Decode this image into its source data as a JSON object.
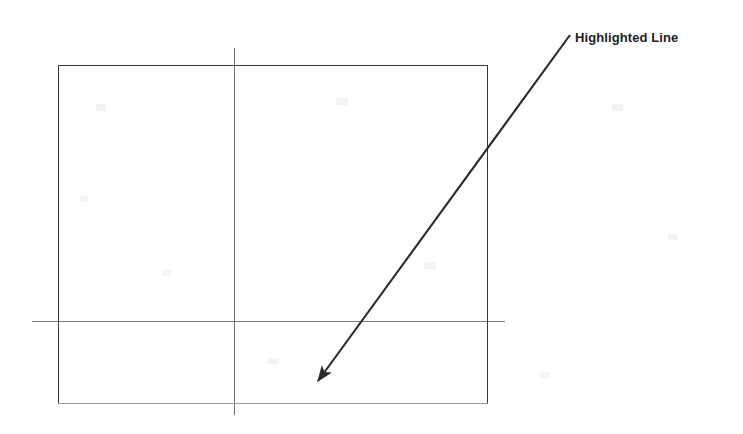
{
  "figure": {
    "background_color": "#ffffff",
    "width": 743,
    "height": 434,
    "annotation": {
      "label": "Highlighted Line",
      "label_color": "#1d1d1d",
      "leader_color": "#2b2b2b",
      "leader_start": [
        570,
        35
      ],
      "leader_tip": [
        311,
        390
      ],
      "arrowhead": "solid-triangle"
    },
    "shapes": {
      "rectangle": {
        "name": "outline-rectangle",
        "x": 58,
        "y": 65,
        "width": 430,
        "height": 339,
        "stroke_color": "#3a3a3a",
        "stroke_width": 1.6,
        "bottom_edge_color": "#9a9a9a",
        "bottom_edge_width": 1.2
      },
      "vertical_line": {
        "name": "vertical-centerline",
        "x": 234,
        "y1": 48,
        "y2": 415,
        "stroke_color": "#6f6f6f",
        "stroke_width": 1.2
      },
      "horizontal_line": {
        "name": "horizontal-centerline",
        "x1": 32,
        "x2": 505,
        "y": 321,
        "stroke_color": "#777777",
        "stroke_width": 1.2
      }
    },
    "artifacts": [
      {
        "x": 96,
        "y": 104,
        "w": 10,
        "h": 7,
        "color": "#f0f0f0"
      },
      {
        "x": 336,
        "y": 98,
        "w": 12,
        "h": 7,
        "color": "#f1f1f1"
      },
      {
        "x": 612,
        "y": 104,
        "w": 11,
        "h": 7,
        "color": "#f1f1f1"
      },
      {
        "x": 162,
        "y": 270,
        "w": 9,
        "h": 6,
        "color": "#f2f2f2"
      },
      {
        "x": 424,
        "y": 262,
        "w": 12,
        "h": 7,
        "color": "#f1f1f1"
      },
      {
        "x": 668,
        "y": 234,
        "w": 10,
        "h": 6,
        "color": "#f2f2f2"
      },
      {
        "x": 268,
        "y": 358,
        "w": 11,
        "h": 6,
        "color": "#f2f2f2"
      },
      {
        "x": 540,
        "y": 372,
        "w": 10,
        "h": 6,
        "color": "#f2f2f2"
      },
      {
        "x": 80,
        "y": 196,
        "w": 8,
        "h": 6,
        "color": "#f3f3f3"
      }
    ]
  }
}
